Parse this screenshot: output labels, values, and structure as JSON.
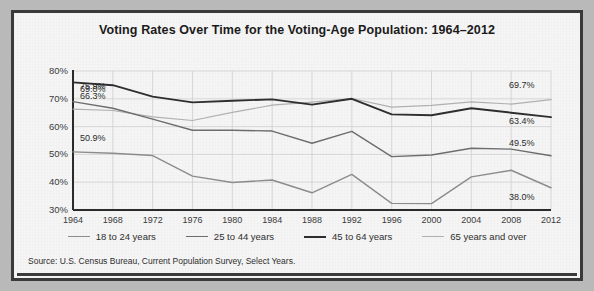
{
  "chart_data": {
    "type": "line",
    "title": "Voting Rates Over Time for the Voting-Age Population: 1964–2012",
    "xlabel": "",
    "ylabel": "",
    "ylim": [
      30,
      80
    ],
    "ytick_labels": [
      "80%",
      "70%",
      "60%",
      "50%",
      "40%",
      "30%"
    ],
    "ytick_values": [
      80,
      70,
      60,
      50,
      40,
      30
    ],
    "grid": true,
    "legend_position": "bottom",
    "x": [
      1964,
      1968,
      1972,
      1976,
      1980,
      1984,
      1988,
      1992,
      1996,
      2000,
      2004,
      2008,
      2012
    ],
    "xtick_labels": [
      "1964",
      "1968",
      "1972",
      "1976",
      "1980",
      "1984",
      "1988",
      "1992",
      "1996",
      "2000",
      "2004",
      "2008",
      "2012"
    ],
    "series": [
      {
        "name": "18 to 24 years",
        "color": "#8c8c8c",
        "values": [
          50.9,
          50.4,
          49.6,
          42.2,
          39.9,
          40.8,
          36.2,
          42.8,
          32.4,
          32.3,
          41.9,
          44.3,
          38.0
        ],
        "start_label": "50.9%",
        "end_label": "38.0%"
      },
      {
        "name": "25 to 44 years",
        "color": "#6d6d6d",
        "values": [
          69.0,
          66.6,
          62.7,
          58.7,
          58.7,
          58.4,
          54.0,
          58.3,
          49.2,
          49.8,
          52.2,
          51.9,
          49.5
        ],
        "start_label": "69.0%",
        "end_label": "49.5%"
      },
      {
        "name": "45 to 64 years",
        "color": "#2e2e2e",
        "values": [
          75.9,
          74.9,
          70.8,
          68.7,
          69.3,
          69.8,
          67.9,
          70.0,
          64.4,
          64.1,
          66.6,
          65.0,
          63.4
        ],
        "start_label": "75.9%",
        "end_label": "63.4%"
      },
      {
        "name": "65 years and over",
        "color": "#b0b0b0",
        "values": [
          66.3,
          65.8,
          63.5,
          62.2,
          65.1,
          67.7,
          68.8,
          70.1,
          67.0,
          67.6,
          68.9,
          68.1,
          69.7
        ],
        "start_label": "66.3%",
        "end_label": "69.7%"
      }
    ],
    "annotations": {
      "left": [
        "75.9%",
        "69.0%",
        "66.3%",
        "50.9%"
      ],
      "right": [
        "69.7%",
        "63.4%",
        "49.5%",
        "38.0%"
      ]
    },
    "source": "Source: U.S. Census Bureau, Current Population Survey, Select Years."
  },
  "colors": {
    "frame_border": "#3a3a3a",
    "background": "#e9e9e9",
    "axis": "#2b2b2b",
    "grid": "#cfcfcf",
    "text": "#2a2a2a"
  }
}
